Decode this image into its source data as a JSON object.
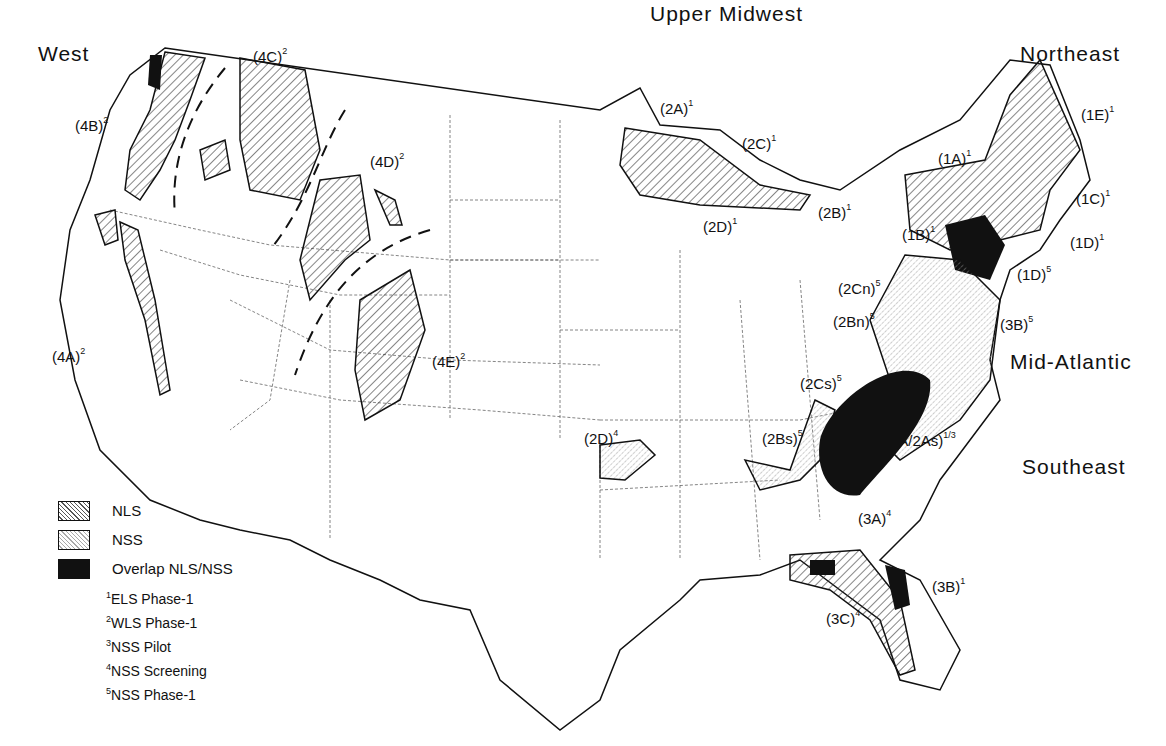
{
  "regions": [
    {
      "name": "West",
      "x": 38,
      "y": 42
    },
    {
      "name": "Upper Midwest",
      "x": 650,
      "y": 2
    },
    {
      "name": "Northeast",
      "x": 1020,
      "y": 42
    },
    {
      "name": "Mid-Atlantic",
      "x": 1010,
      "y": 350
    },
    {
      "name": "Southeast",
      "x": 1022,
      "y": 455
    }
  ],
  "subregions": [
    {
      "code": "(4B)",
      "sup": "2",
      "x": 75,
      "y": 117
    },
    {
      "code": "(4C)",
      "sup": "2",
      "x": 253,
      "y": 48
    },
    {
      "code": "(4D)",
      "sup": "2",
      "x": 370,
      "y": 153
    },
    {
      "code": "(4A)",
      "sup": "2",
      "x": 52,
      "y": 348
    },
    {
      "code": "(4E)",
      "sup": "2",
      "x": 432,
      "y": 353
    },
    {
      "code": "(2A)",
      "sup": "1",
      "x": 660,
      "y": 100
    },
    {
      "code": "(2C)",
      "sup": "1",
      "x": 742,
      "y": 135
    },
    {
      "code": "(2D)",
      "sup": "1",
      "x": 703,
      "y": 218
    },
    {
      "code": "(2B)",
      "sup": "1",
      "x": 818,
      "y": 204
    },
    {
      "code": "(1A)",
      "sup": "1",
      "x": 938,
      "y": 150
    },
    {
      "code": "(1E)",
      "sup": "1",
      "x": 1081,
      "y": 106
    },
    {
      "code": "(1C)",
      "sup": "1",
      "x": 1076,
      "y": 190
    },
    {
      "code": "(1B)",
      "sup": "1",
      "x": 902,
      "y": 226
    },
    {
      "code": "(1D)",
      "sup": "1",
      "x": 1070,
      "y": 234
    },
    {
      "code": "(1D)",
      "sup": "5",
      "x": 1017,
      "y": 266
    },
    {
      "code": "(2Cn)",
      "sup": "5",
      "x": 838,
      "y": 280
    },
    {
      "code": "(2Bn)",
      "sup": "5",
      "x": 833,
      "y": 313
    },
    {
      "code": "(3B)",
      "sup": "5",
      "x": 1000,
      "y": 316
    },
    {
      "code": "(2Cs)",
      "sup": "5",
      "x": 800,
      "y": 375
    },
    {
      "code": "(2D)",
      "sup": "4",
      "x": 584,
      "y": 430
    },
    {
      "code": "(2Bs)",
      "sup": "5",
      "x": 762,
      "y": 430
    },
    {
      "code": "(3A/2As)",
      "sup": "1/3",
      "x": 885,
      "y": 432
    },
    {
      "code": "(3A)",
      "sup": "4",
      "x": 858,
      "y": 510
    },
    {
      "code": "(3B)",
      "sup": "1",
      "x": 932,
      "y": 578
    },
    {
      "code": "(3C)",
      "sup": "4",
      "x": 826,
      "y": 610
    }
  ],
  "legend": {
    "patterns": [
      {
        "key": "nls",
        "label": "NLS"
      },
      {
        "key": "nss",
        "label": "NSS"
      },
      {
        "key": "ovl",
        "label": "Overlap NLS/NSS"
      }
    ],
    "notes": [
      {
        "sup": "1",
        "label": "ELS Phase-1"
      },
      {
        "sup": "2",
        "label": "WLS Phase-1"
      },
      {
        "sup": "3",
        "label": "NSS Pilot"
      },
      {
        "sup": "4",
        "label": "NSS Screening"
      },
      {
        "sup": "5",
        "label": "NSS Phase-1"
      }
    ]
  }
}
